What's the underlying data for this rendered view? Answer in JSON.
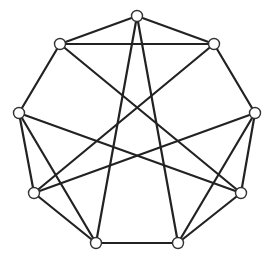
{
  "diagram": {
    "type": "graph",
    "style": {
      "edge_color": "#222222",
      "node_fill": "#ffffff",
      "node_stroke": "#333333",
      "node_radius": 5.5,
      "background": "#ffffff"
    },
    "nodes": [
      {
        "id": "n0",
        "position": "top",
        "x": 137,
        "y": 16
      },
      {
        "id": "n1",
        "position": "upper-right",
        "x": 214,
        "y": 44
      },
      {
        "id": "n2",
        "position": "right",
        "x": 255,
        "y": 113
      },
      {
        "id": "n3",
        "position": "lower-right",
        "x": 241,
        "y": 193
      },
      {
        "id": "n4",
        "position": "bottom-right",
        "x": 178,
        "y": 243
      },
      {
        "id": "n5",
        "position": "bottom-left",
        "x": 96,
        "y": 243
      },
      {
        "id": "n6",
        "position": "lower-left",
        "x": 34,
        "y": 193
      },
      {
        "id": "n7",
        "position": "left",
        "x": 19,
        "y": 113
      },
      {
        "id": "n8",
        "position": "upper-left",
        "x": 60,
        "y": 44
      }
    ],
    "edges": [
      [
        "n0",
        "n8"
      ],
      [
        "n0",
        "n1"
      ],
      [
        "n8",
        "n1"
      ],
      [
        "n0",
        "n5"
      ],
      [
        "n0",
        "n4"
      ],
      [
        "n8",
        "n7"
      ],
      [
        "n8",
        "n3"
      ],
      [
        "n1",
        "n2"
      ],
      [
        "n1",
        "n6"
      ],
      [
        "n7",
        "n3"
      ],
      [
        "n7",
        "n6"
      ],
      [
        "n7",
        "n5"
      ],
      [
        "n2",
        "n6"
      ],
      [
        "n2",
        "n3"
      ],
      [
        "n2",
        "n4"
      ],
      [
        "n6",
        "n5"
      ],
      [
        "n5",
        "n4"
      ],
      [
        "n3",
        "n4"
      ]
    ]
  }
}
